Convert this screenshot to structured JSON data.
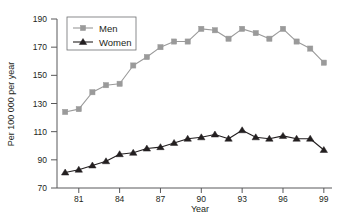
{
  "chart_data": {
    "type": "line",
    "title": "",
    "xlabel": "Year",
    "ylabel": "Per 100 000 per year",
    "xlim": [
      79.4,
      99.6
    ],
    "ylim": [
      70,
      190
    ],
    "xticks": [
      81,
      84,
      87,
      90,
      93,
      96,
      99
    ],
    "xtick_labels": [
      "81",
      "84",
      "87",
      "90",
      "93",
      "96",
      "99"
    ],
    "yticks": [
      70,
      90,
      110,
      130,
      150,
      170,
      190
    ],
    "ytick_labels": [
      "70",
      "90",
      "110",
      "130",
      "150",
      "170",
      "190"
    ],
    "grid": false,
    "legend_position": "top-left",
    "x": [
      80,
      81,
      82,
      83,
      84,
      85,
      86,
      87,
      88,
      89,
      90,
      91,
      92,
      93,
      94,
      95,
      96,
      97,
      98,
      99
    ],
    "series": [
      {
        "name": "Men",
        "color": "#9a9a9a",
        "marker": "square",
        "values": [
          124,
          126,
          138,
          143,
          144,
          157,
          163,
          170,
          174,
          174,
          183,
          182,
          176,
          183,
          180,
          176,
          183,
          174,
          169,
          159
        ]
      },
      {
        "name": "Women",
        "color": "#231f20",
        "marker": "triangle",
        "values": [
          81,
          83,
          86,
          89,
          94,
          95,
          98,
          99,
          102,
          105,
          106,
          108,
          105,
          111,
          106,
          105,
          107,
          105,
          105,
          97
        ]
      }
    ]
  },
  "legend": {
    "items": [
      {
        "label": "Men"
      },
      {
        "label": "Women"
      }
    ]
  },
  "axes": {
    "x_title": "Year",
    "y_title": "Per 100 000 per year"
  }
}
